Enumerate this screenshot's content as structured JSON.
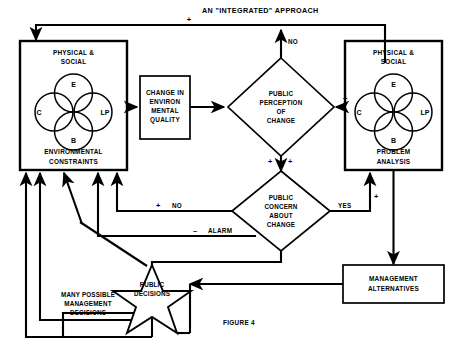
{
  "figure": {
    "title": "AN \"INTEGRATED\" APPROACH",
    "caption": "FIGURE 4"
  },
  "nodes": {
    "environmental_constraints": {
      "header_line1": "PHYSICAL &",
      "header_line2": "SOCIAL",
      "footer_line1": "ENVIRONMENTAL",
      "footer_line2": "CONSTRAINTS",
      "circles": {
        "top": "E",
        "left": "C",
        "right": "LP",
        "bottom": "B"
      }
    },
    "problem_analysis": {
      "header_line1": "PHYSICAL &",
      "header_line2": "SOCIAL",
      "footer_line1": "PROBLEM",
      "footer_line2": "ANALYSIS",
      "circles": {
        "top": "E",
        "left": "C",
        "right": "LP",
        "bottom": "B"
      }
    },
    "change_box": {
      "line1": "CHANGE IN",
      "line2": "ENVIRON",
      "line3": "MENTAL",
      "line4": "QUALITY"
    },
    "perception_diamond": {
      "line1": "PUBLIC",
      "line2": "PERCEPTION",
      "line3": "OF",
      "line4": "CHANGE"
    },
    "concern_diamond": {
      "line1": "PUBLIC",
      "line2": "CONCERN",
      "line3": "ABOUT",
      "line4": "CHANGE"
    },
    "management_alternatives": {
      "line1": "MANAGEMENT",
      "line2": "ALTERNATIVES"
    },
    "public_decisions_star": {
      "line1": "PUBLIC",
      "line2": "DECISIONS"
    },
    "many_decisions": {
      "line1": "MANY POSSIBLE",
      "line2": "MANAGEMENT",
      "line3": "DECISIONS"
    }
  },
  "edge_labels": {
    "top_feedback_sign": "+",
    "no_up": "NO",
    "perception_in_sign": "+",
    "between_diamonds_left_sign": "+",
    "between_diamonds_right_sign": "+",
    "concern_no_sign": "+",
    "concern_no": "NO",
    "concern_yes": "YES",
    "yes_up_sign": "+",
    "alarm_sign": "–",
    "alarm": "ALARM"
  },
  "colors": {
    "ink": "#000000",
    "paper": "#ffffff"
  }
}
